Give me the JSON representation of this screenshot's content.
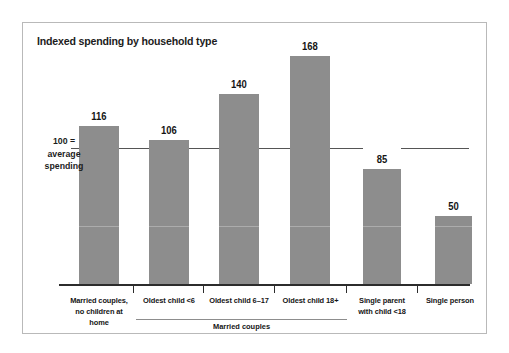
{
  "figure": {
    "title": "Indexed spending by household type",
    "reference_label_lines": [
      "100 =",
      "average",
      "spending"
    ],
    "group_bracket_label": "Married couples"
  },
  "chart_data": {
    "type": "bar",
    "title": "Indexed spending by household type",
    "xlabel": "",
    "ylabel": "",
    "ylim": [
      0,
      180
    ],
    "grid": false,
    "legend": "none",
    "reference_line": {
      "value": 100,
      "label": "100 = average spending"
    },
    "categories": [
      "Married couples, no children at home",
      "Oldest child <6",
      "Oldest child 6–17",
      "Oldest child 18+",
      "Single parent with child <18",
      "Single person"
    ],
    "category_label_lines": [
      [
        "Married couples,",
        "no children at home"
      ],
      [
        "Oldest child <6"
      ],
      [
        "Oldest child 6–17"
      ],
      [
        "Oldest child 18+"
      ],
      [
        "Single parent",
        "with child <18"
      ],
      [
        "Single person"
      ]
    ],
    "values": [
      116,
      106,
      140,
      168,
      85,
      50
    ],
    "value_labels": [
      "116",
      "106",
      "140",
      "168",
      "85",
      "50"
    ],
    "group_brackets": [
      {
        "label": "Married couples",
        "covers": [
          "Oldest child <6",
          "Oldest child 6–17",
          "Oldest child 18+"
        ]
      }
    ],
    "colors": {
      "bar": "#8d8d8d",
      "axis": "#2c2c2c",
      "reference_line": "#555555",
      "text": "#151515",
      "border": "#b9b9b9",
      "background": "#ffffff"
    }
  }
}
